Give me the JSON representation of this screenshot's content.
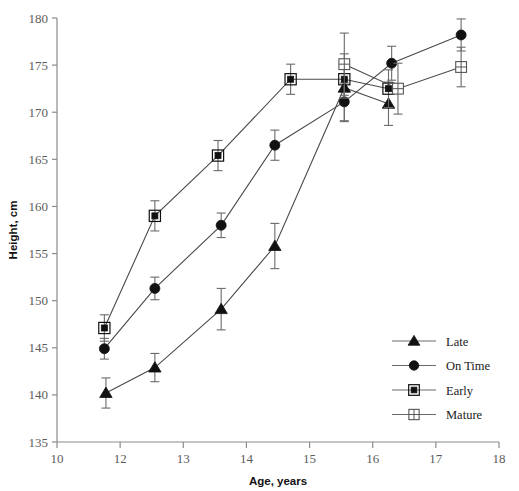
{
  "chart_data": {
    "type": "line",
    "title": "",
    "xlabel": "Age, years",
    "ylabel": "Height, cm",
    "xlim": [
      10,
      18
    ],
    "ylim": [
      135,
      180
    ],
    "xticks": [
      10,
      12,
      13,
      14,
      15,
      16,
      17,
      18
    ],
    "xtick_labels": [
      "10",
      "12",
      "13",
      "14",
      "15",
      "16",
      "17",
      "18"
    ],
    "yticks": [
      135,
      140,
      145,
      150,
      155,
      160,
      165,
      170,
      175,
      180
    ],
    "ytick_labels": [
      "135",
      "140",
      "145",
      "150",
      "155",
      "160",
      "165",
      "170",
      "175",
      "180"
    ],
    "grid": false,
    "legend_position": "right-middle",
    "errorbars": "vertical",
    "series": [
      {
        "name": "Late",
        "marker": "filled-triangle",
        "x": [
          11.55,
          12.55,
          13.6,
          14.45,
          15.55,
          16.25
        ],
        "y": [
          140.2,
          142.9,
          149.1,
          155.8,
          172.6,
          170.9
        ],
        "yerr": [
          1.6,
          1.5,
          2.2,
          2.4,
          3.6,
          2.3
        ]
      },
      {
        "name": "On Time",
        "marker": "filled-circle",
        "x": [
          11.5,
          12.55,
          13.6,
          14.45,
          15.55,
          16.3,
          17.4
        ],
        "y": [
          144.9,
          151.3,
          158.0,
          166.5,
          171.1,
          175.2,
          178.2
        ],
        "yerr": [
          1.1,
          1.2,
          1.3,
          1.6,
          2.0,
          1.8,
          1.7
        ]
      },
      {
        "name": "Early",
        "marker": "filled-square-ring",
        "x": [
          11.5,
          12.55,
          13.55,
          14.7,
          15.55,
          16.25
        ],
        "y": [
          147.1,
          159.0,
          165.4,
          173.5,
          173.5,
          172.5
        ],
        "yerr": [
          1.4,
          1.6,
          1.6,
          1.6,
          2.0,
          2.0
        ]
      },
      {
        "name": "Mature",
        "marker": "open-square-cross",
        "x": [
          15.55,
          16.4,
          17.4
        ],
        "y": [
          175.1,
          172.5,
          174.8
        ],
        "yerr": [
          3.3,
          2.7,
          2.1
        ]
      }
    ],
    "legend": [
      {
        "label": "Late",
        "marker": "filled-triangle"
      },
      {
        "label": "On Time",
        "marker": "filled-circle"
      },
      {
        "label": "Early",
        "marker": "filled-square-ring"
      },
      {
        "label": "Mature",
        "marker": "open-square-cross"
      }
    ]
  }
}
